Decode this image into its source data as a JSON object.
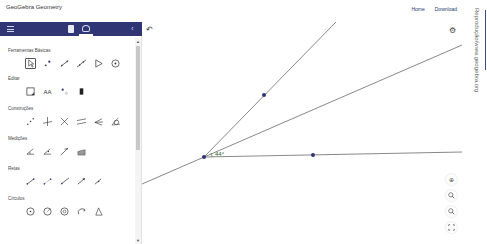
{
  "app": {
    "title": "GeoGebra Geometry",
    "links": [
      "Home",
      "Download"
    ]
  },
  "sidebar": {
    "header": {
      "menu_icon": "hamburger-icon",
      "tabs": [
        {
          "name": "document-icon"
        },
        {
          "name": "tools-icon",
          "active": true
        }
      ],
      "collapse_icon": "chevron-left-icon",
      "collapse_glyph": "‹"
    },
    "sections": [
      {
        "title": "Ferramentas Básicas",
        "tools": [
          "move",
          "point",
          "segment",
          "line",
          "polygon",
          "circle-center-point"
        ]
      },
      {
        "title": "Editar",
        "tools": [
          "move-graphics-view",
          "text",
          "show-hide-label",
          "delete"
        ]
      },
      {
        "title": "Construções",
        "tools": [
          "midpoint",
          "perpendicular-line",
          "perpendicular-bisector",
          "parallel-line",
          "angle-bisector",
          "tangents"
        ]
      },
      {
        "title": "Medições",
        "tools": [
          "angle",
          "angle-given-size",
          "distance",
          "area"
        ]
      },
      {
        "title": "Retas",
        "tools": [
          "segment",
          "segment-fixed-length",
          "ray",
          "vector",
          "vector-from-point"
        ]
      },
      {
        "title": "Círculos",
        "tools": [
          "circle-center-point",
          "circle-center-radius",
          "compass",
          "semicircle",
          "circle-three-points"
        ]
      }
    ],
    "text_tool_label": "AA"
  },
  "canvas": {
    "undo_glyph": "↶",
    "settings_glyph": "⚙",
    "angle_label": "44°",
    "vertex": {
      "x": 204,
      "y": 157
    },
    "points": [
      {
        "x": 264,
        "y": 95
      },
      {
        "x": 313,
        "y": 155
      }
    ],
    "lines": [
      {
        "x1": 204,
        "y1": 157,
        "x2": 336,
        "y2": 22
      },
      {
        "x1": 142,
        "y1": 184,
        "x2": 462,
        "y2": 45
      },
      {
        "x1": 204,
        "y1": 157,
        "x2": 462,
        "y2": 152
      }
    ],
    "zoom_controls": [
      {
        "name": "home-icon",
        "glyph": "⊕"
      },
      {
        "name": "zoom-in-icon",
        "glyph": "🔍"
      },
      {
        "name": "zoom-out-icon",
        "glyph": "🔍"
      },
      {
        "name": "fullscreen-icon",
        "glyph": "⛶"
      }
    ],
    "colors": {
      "line": "#6a6a6a",
      "point": "#2f3575",
      "angle": "#2a5e2a"
    }
  },
  "credit": "Reprodução/www.geogebra.org",
  "colors": {
    "header_bg": "#2f3575",
    "accent": "#3f4b8a"
  }
}
